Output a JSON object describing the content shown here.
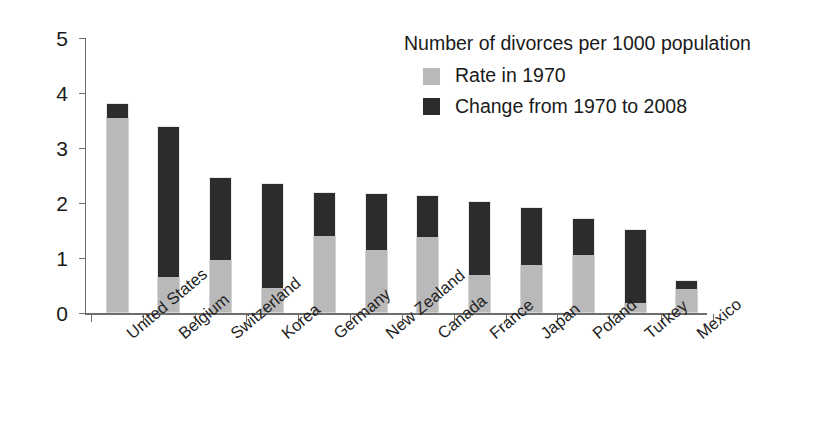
{
  "chart_data": {
    "type": "bar",
    "subtype": "stacked-vertical",
    "title": "Number of divorces per 1000 population",
    "xlabel": "",
    "ylabel": "",
    "ylim": [
      0,
      5
    ],
    "y_ticks": [
      0,
      1,
      2,
      3,
      4,
      5
    ],
    "y_tick_labels": [
      "0",
      "1",
      "2",
      "3",
      "4",
      "5"
    ],
    "grid": false,
    "legend_position": "top-right-inside",
    "categories": [
      "United States",
      "Belgium",
      "Switzerland",
      "Korea",
      "Germany",
      "New Zealand",
      "Canada",
      "France",
      "Japan",
      "Poland",
      "Turkey",
      "Mexico"
    ],
    "series": [
      {
        "name": "Rate in 1970",
        "color": "#b9b9b9",
        "values": [
          3.55,
          0.65,
          0.97,
          0.45,
          1.4,
          1.15,
          1.38,
          0.7,
          0.87,
          1.05,
          0.18,
          0.44
        ]
      },
      {
        "name": "Change from 1970 to 2008",
        "color": "#2c2c2c",
        "values": [
          0.27,
          2.75,
          1.5,
          1.92,
          0.8,
          1.04,
          0.77,
          1.34,
          1.05,
          0.67,
          1.34,
          0.16
        ]
      }
    ],
    "totals": [
      3.82,
      3.4,
      2.47,
      2.37,
      2.2,
      2.19,
      2.15,
      2.04,
      1.92,
      1.72,
      1.52,
      0.6
    ]
  },
  "legend": {
    "title": "Number of divorces per 1000 population",
    "entries": [
      {
        "label": "Rate in 1970",
        "swatch": "light-gray-swatch"
      },
      {
        "label": "Change from 1970 to 2008",
        "swatch": "dark-gray-swatch"
      }
    ]
  },
  "colors": {
    "rate_1970": "#b9b9b9",
    "change_1970_2008": "#2c2c2c",
    "axis": "#6e6e6e",
    "text": "#1a1a1a",
    "background": "#ffffff"
  }
}
